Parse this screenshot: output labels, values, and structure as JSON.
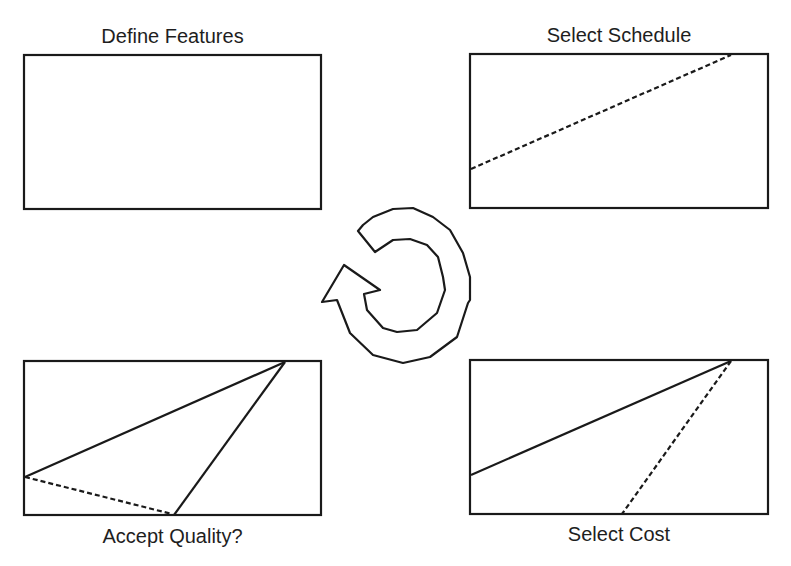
{
  "diagram": {
    "type": "cycle-of-four-panels",
    "center_icon": "circular-arrow-counterclockwise",
    "panels": [
      {
        "id": "define-features",
        "label": "Define Features",
        "position": "top-left",
        "label_position": "above",
        "lines": []
      },
      {
        "id": "select-schedule",
        "label": "Select Schedule",
        "position": "top-right",
        "label_position": "above",
        "lines": [
          {
            "style": "dashed",
            "from": "left-edge lower",
            "to": "top-edge right"
          }
        ]
      },
      {
        "id": "select-cost",
        "label": "Select Cost",
        "position": "bottom-right",
        "label_position": "below",
        "lines": [
          {
            "style": "solid",
            "from": "left-edge lower",
            "to": "top-edge right"
          },
          {
            "style": "dashed",
            "from": "top-edge right",
            "to": "bottom-edge middle"
          }
        ]
      },
      {
        "id": "accept-quality",
        "label": "Accept Quality?",
        "position": "bottom-left",
        "label_position": "below",
        "lines": [
          {
            "style": "solid",
            "from": "left-edge lower",
            "to": "top-edge right"
          },
          {
            "style": "solid",
            "from": "top-edge right",
            "to": "bottom-edge middle"
          },
          {
            "style": "dashed",
            "from": "left-edge lower",
            "to": "bottom-edge middle"
          }
        ]
      }
    ],
    "colors": {
      "stroke": "#1a1a1a",
      "background": "#ffffff"
    }
  }
}
